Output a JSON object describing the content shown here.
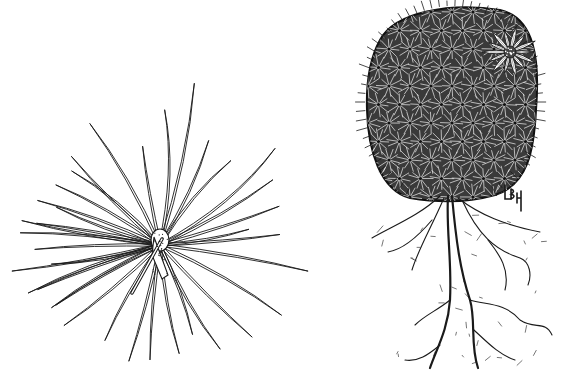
{
  "illustration": {
    "style": "black ink botanical line drawing on white",
    "background": "#ffffff",
    "ink": "#1a1a1a",
    "panels": [
      {
        "id": "spine-cluster",
        "subject": "single areole spine cluster",
        "center": [
          160,
          245
        ]
      },
      {
        "id": "cactus-plant",
        "subject": "globular spiny cactus with flower and roots",
        "body_bbox": [
          367,
          8,
          535,
          195
        ],
        "flower_center": [
          510,
          52
        ],
        "roots_extent_y": [
          195,
          372
        ]
      }
    ],
    "signature": {
      "text": "LBH",
      "position": [
        505,
        185
      ]
    }
  }
}
